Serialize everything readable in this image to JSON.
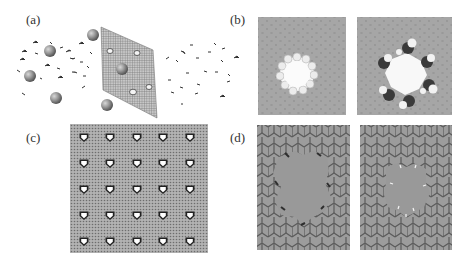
{
  "figure": {
    "panels": [
      {
        "id": "a",
        "label": "(a)",
        "description": "Ions and water molecules permeating through a porous graphene membrane"
      },
      {
        "id": "b",
        "label": "(b)",
        "description": "Space-filling views of two functionalized pores in graphene"
      },
      {
        "id": "c",
        "label": "(c)",
        "description": "Graphene sheet with 5x5 periodic array of pores"
      },
      {
        "id": "d",
        "label": "(d)",
        "description": "Honeycomb lattice views of two pore geometries"
      }
    ],
    "colors": {
      "background": "#ffffff",
      "sheet_gray": "#9a9a9a",
      "ion_gray": "#8c8c8c",
      "hex_fill": "#9c9c9c",
      "hex_edge": "#555555",
      "pore_white": "#f6f6f6",
      "dark_atom": "#3a3a3a"
    },
    "panel_c_grid": {
      "rows": 5,
      "cols": 5
    }
  }
}
